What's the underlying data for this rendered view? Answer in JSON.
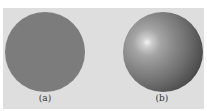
{
  "figure": {
    "panels": [
      {
        "id": "a",
        "caption": "(a)",
        "description": "flat shaded sphere",
        "color": "#7c7c7c"
      },
      {
        "id": "b",
        "caption": "(b)",
        "description": "smooth shaded sphere with specular highlight",
        "highlight_color": "#f4f4f4",
        "shadow_color": "#2a2a2a"
      }
    ],
    "background_color": "#dedede"
  }
}
